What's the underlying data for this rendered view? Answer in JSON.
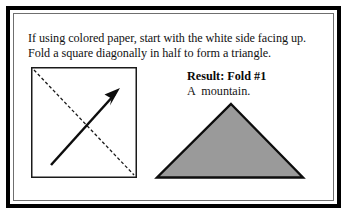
{
  "figure": {
    "instruction_text": "If using colored paper, start with the white side facing up. Fold a square diagonally in half to form a triangle.",
    "result": {
      "title": "Result: Fold #1",
      "subtitle": "A  mountain."
    },
    "left_diagram": {
      "shape_name": "square-sheet",
      "fold_line_style": "dashed",
      "fold_line_direction": "top-left-to-bottom-right",
      "arrow_direction": "bottom-left-to-top-right",
      "outline_color": "#000000",
      "fill_color": "#ffffff"
    },
    "right_diagram": {
      "shape_name": "triangle",
      "orientation": "apex-up",
      "fill_color": "#9a9a9a",
      "outline_color": "#000000"
    },
    "frame": {
      "outer_border_color": "#000000",
      "inner_border_color": "#6f6f6f",
      "background_color": "#ffffff"
    }
  }
}
